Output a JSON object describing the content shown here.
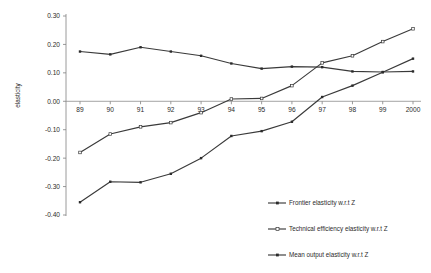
{
  "chart_data": {
    "type": "line",
    "title": "",
    "subtitle": "",
    "xlabel": "",
    "ylabel": "elasticity",
    "categories": [
      "89",
      "90",
      "91",
      "92",
      "93",
      "94",
      "95",
      "96",
      "97",
      "98",
      "99",
      "2000"
    ],
    "ylim": [
      -0.4,
      0.3
    ],
    "ytick_labels": [
      "0.30",
      "0.20",
      "0.10",
      "0.00",
      "-0.10",
      "-0.20",
      "-0.30",
      "-0.40"
    ],
    "ytick_values": [
      0.3,
      0.2,
      0.1,
      0.0,
      -0.1,
      -0.2,
      -0.3,
      -0.4
    ],
    "grid": false,
    "legend_position": "bottom-right",
    "series": [
      {
        "name": "Frontier elasticity w.r.t Z",
        "marker": "filled-square",
        "values": [
          0.175,
          0.165,
          0.19,
          0.175,
          0.16,
          0.133,
          0.115,
          0.122,
          0.12,
          0.105,
          0.103,
          0.105
        ]
      },
      {
        "name": "Technical efficiency elasticity w.r.t Z",
        "marker": "open-triangle",
        "values": [
          -0.18,
          -0.115,
          -0.09,
          -0.075,
          -0.04,
          0.008,
          0.01,
          0.055,
          0.135,
          0.16,
          0.21,
          0.255
        ]
      },
      {
        "name": "Mean output elasticity w.r.t Z",
        "marker": "filled-square",
        "values": [
          -0.355,
          -0.283,
          -0.285,
          -0.255,
          -0.2,
          -0.122,
          -0.105,
          -0.072,
          0.015,
          0.055,
          0.102,
          0.15
        ]
      }
    ]
  },
  "legend": {
    "items": [
      {
        "label": "Frontier elasticity w.r.t Z"
      },
      {
        "label": "Technical efficiency elasticity w.r.t Z"
      },
      {
        "label": "Mean output elasticity w.r.t Z"
      }
    ]
  },
  "axes": {
    "y_title": "elasticity"
  }
}
